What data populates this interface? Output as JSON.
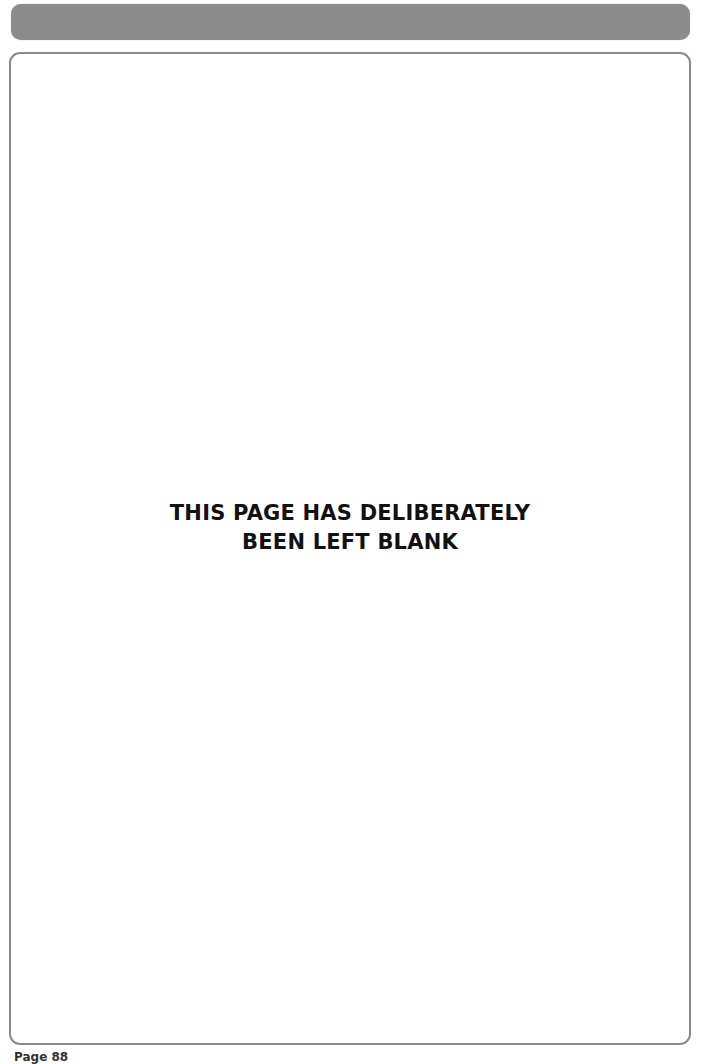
{
  "header": {
    "bar_color": "#8c8c8c"
  },
  "content": {
    "border_color": "#8a8a8a",
    "message_lines": [
      "THIS PAGE HAS DELIBERATELY",
      "BEEN LEFT BLANK"
    ]
  },
  "footer": {
    "page_label": "Page 88"
  }
}
